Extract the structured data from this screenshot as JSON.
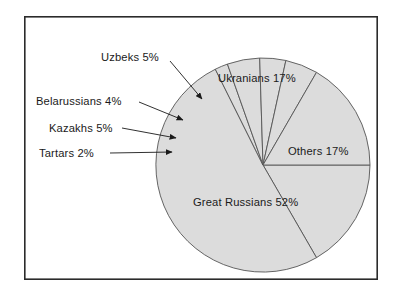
{
  "figure": {
    "background_color": "#ffffff",
    "frame": {
      "name": "chart-border",
      "color": "#2b2b2b",
      "x": 24,
      "y": 16,
      "width": 354,
      "height": 264,
      "stroke_width": 1.6
    }
  },
  "chart_data": {
    "type": "pie",
    "title": "",
    "subtitle": "",
    "xlabel": "",
    "ylabel": "",
    "legend_position": "none",
    "grid": false,
    "total_percent": 102,
    "units": "percent",
    "start_angle_deg": 0,
    "direction": "clockwise",
    "slice_fill_color": "#dcdcdc",
    "slice_stroke_color": "#555555",
    "categories": [
      "Others",
      "Great Russians",
      "Tartars",
      "Kazakhs",
      "Belarussians",
      "Uzbeks",
      "Ukranians"
    ],
    "values": [
      17,
      52,
      2,
      5,
      4,
      5,
      17
    ],
    "slices": [
      {
        "name": "Others",
        "value": 17,
        "label": "Others 17%",
        "label_style": "inside",
        "label_x": 288,
        "label_y": 155
      },
      {
        "name": "Great Russians",
        "value": 52,
        "label": "Great Russians 52%",
        "label_style": "inside",
        "label_x": 193,
        "label_y": 206
      },
      {
        "name": "Tartars",
        "value": 2,
        "label": "Tartars 2%",
        "label_style": "callout",
        "label_x": 39,
        "label_y": 157,
        "arrow_from_x": 110,
        "arrow_from_y": 153,
        "arrow_to_x": 172,
        "arrow_to_y": 152
      },
      {
        "name": "Kazakhs",
        "value": 5,
        "label": "Kazakhs 5%",
        "label_style": "callout",
        "label_x": 49,
        "label_y": 132,
        "arrow_from_x": 122,
        "arrow_from_y": 128,
        "arrow_to_x": 176,
        "arrow_to_y": 138
      },
      {
        "name": "Belarussians",
        "value": 4,
        "label": "Belarussians 4%",
        "label_style": "callout",
        "label_x": 36,
        "label_y": 105,
        "arrow_from_x": 139,
        "arrow_from_y": 102,
        "arrow_to_x": 183,
        "arrow_to_y": 120
      },
      {
        "name": "Uzbeks",
        "value": 5,
        "label": "Uzbeks 5%",
        "label_style": "callout",
        "label_x": 101,
        "label_y": 61,
        "arrow_from_x": 170,
        "arrow_from_y": 61,
        "arrow_to_x": 202,
        "arrow_to_y": 99
      },
      {
        "name": "Ukranians",
        "value": 17,
        "label": "Ukranians 17%",
        "label_style": "inside",
        "label_x": 218,
        "label_y": 82
      }
    ],
    "geometry": {
      "center_x": 263,
      "center_y": 165,
      "radius": 107
    }
  }
}
